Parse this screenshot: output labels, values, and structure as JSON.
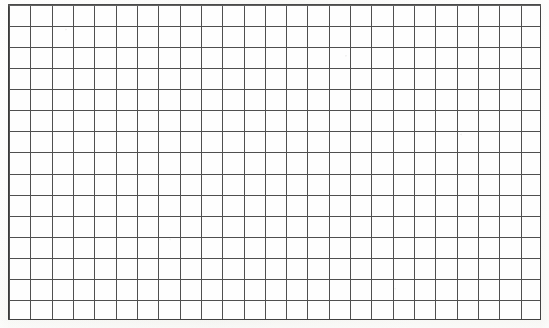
{
  "document": {
    "kind": "blank-graph-paper-scan",
    "has_text": false,
    "has_annotations": false
  },
  "grid": {
    "columns": 25,
    "rows": 15,
    "cell_width_px": 21.32,
    "cell_height_px": 21.07,
    "origin_x_px": 8,
    "origin_y_px": 4,
    "width_px": 533,
    "height_px": 316
  },
  "colors": {
    "page_background": "#ffffff",
    "paper_fill": "#fefefe",
    "paper_tone": "#f6f6f3",
    "rule_line": "#4f4f4f",
    "border_line": "#3a3a3a"
  }
}
